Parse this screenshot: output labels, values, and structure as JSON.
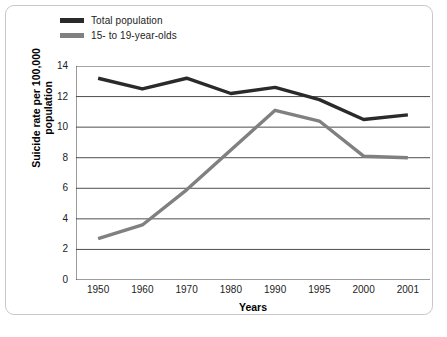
{
  "chart_data": {
    "type": "line",
    "title": "",
    "xlabel": "Years",
    "ylabel": "Suicide rate per 100,000 population",
    "ylabel_line1": "Suicide rate per 100,000",
    "ylabel_line2": "population",
    "categories": [
      "1950",
      "1960",
      "1970",
      "1980",
      "1990",
      "1995",
      "2000",
      "2001"
    ],
    "ylim": [
      0,
      14
    ],
    "yticks": [
      0,
      2,
      4,
      6,
      8,
      10,
      12,
      14
    ],
    "ytick_labels": [
      "0",
      "2",
      "4",
      "6",
      "8",
      "10",
      "12",
      "14"
    ],
    "grid": "horizontal",
    "legend_position": "top-left",
    "series": [
      {
        "name": "Total population",
        "color": "#2a2a2a",
        "values": [
          13.2,
          12.5,
          13.2,
          12.2,
          12.6,
          11.8,
          10.5,
          10.8
        ]
      },
      {
        "name": "15- to 19-year-olds",
        "color": "#808080",
        "values": [
          2.7,
          3.6,
          5.9,
          8.5,
          11.1,
          10.4,
          8.1,
          8.0
        ]
      }
    ]
  },
  "legend": {
    "items": [
      {
        "label": "Total population",
        "color": "#2a2a2a"
      },
      {
        "label": "15- to 19-year-olds",
        "color": "#808080"
      }
    ]
  },
  "axes": {
    "x_title": "Years",
    "y_title_line1": "Suicide rate per 100,000",
    "y_title_line2": "population"
  }
}
